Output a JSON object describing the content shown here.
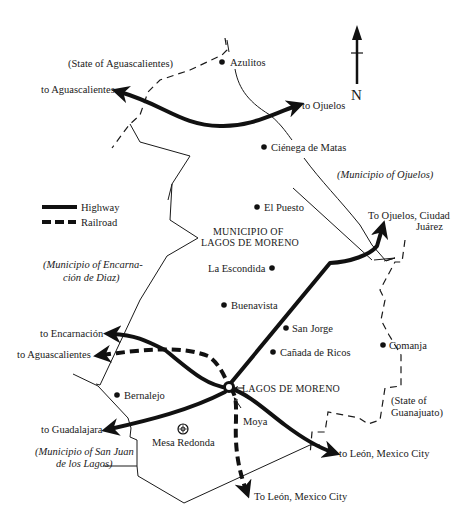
{
  "map": {
    "compass": {
      "label": "N",
      "icon": "north-arrow-icon"
    },
    "legend": [
      {
        "label": "Highway",
        "style": "solid"
      },
      {
        "label": "Railroad",
        "style": "dashed"
      }
    ],
    "regions": {
      "state_aguascalientes": "(State of Aguascalientes)",
      "municipio_ojuelos": "(Municipio of Ojuelos)",
      "municipio_encarnacion_line1": "(Municipio of Encarna-",
      "municipio_encarnacion_line2": "ción de Diaz)",
      "municipio_lagos_line1": "MUNICIPIO OF",
      "municipio_lagos_line2": "LAGOS DE MORENO",
      "municipio_san_juan_line1": "(Municipio of San Juan",
      "municipio_san_juan_line2": "de los Lagos)",
      "state_guanajuato_line1": "(State of",
      "state_guanajuato_line2": "Guanajuato)"
    },
    "towns": [
      {
        "name": "Azulitos"
      },
      {
        "name": "Ciénega de Matas"
      },
      {
        "name": "El Puesto"
      },
      {
        "name": "La Escondida"
      },
      {
        "name": "Buenavista"
      },
      {
        "name": "San Jorge"
      },
      {
        "name": "Cañada de Ricos"
      },
      {
        "name": "Comanja"
      },
      {
        "name": "Bernalejo"
      },
      {
        "name": "Moya"
      }
    ],
    "capital": "LAGOS DE MORENO",
    "landmark": {
      "name": "Mesa Redonda",
      "icon": "mesa-redonda-symbol-icon"
    },
    "destinations": {
      "to_aguascalientes_north": "to Aguascalientes",
      "to_ojuelos": "to Ojuelos",
      "to_ojuelos_juarez_line1": "To Ojuelos, Ciudad",
      "to_ojuelos_juarez_line2": "Juárez",
      "to_encarnacion": "to Encarnación",
      "to_aguascalientes_rail": "to Aguascalientes",
      "to_guadalajara": "to Guadalajara",
      "to_leon_highway": "to León, Mexico City",
      "to_leon_rail": "To León, Mexico City"
    },
    "colors": {
      "ink": "#111111",
      "background": "#ffffff"
    }
  }
}
